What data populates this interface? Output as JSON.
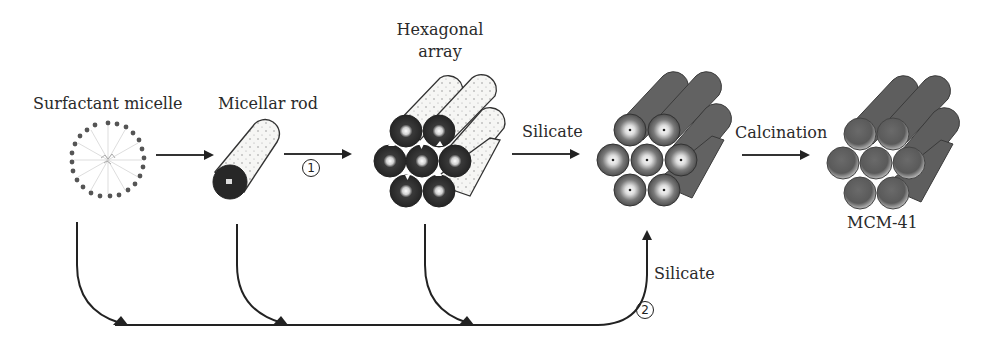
{
  "diagram": {
    "stages": [
      {
        "id": "surfactant-micelle",
        "label": "Surfactant micelle"
      },
      {
        "id": "micellar-rod",
        "label": "Micellar rod"
      },
      {
        "id": "hexagonal-array",
        "label_line1": "Hexagonal",
        "label_line2": "array"
      },
      {
        "id": "silicate-array",
        "label": ""
      },
      {
        "id": "mcm-41",
        "label": "MCM-41"
      }
    ],
    "arrows": {
      "a1": "",
      "route1_marker": "1",
      "silicate_top": "Silicate",
      "calcination": "Calcination",
      "silicate_bottom": "Silicate",
      "route2_marker": "2"
    },
    "colors": {
      "ink": "#222222",
      "rod_body": "#f4f4f2",
      "rod_dark": "#2b2b2b",
      "silica_gray": "#6a6a6a",
      "silica_light": "#8a8a8a"
    }
  }
}
